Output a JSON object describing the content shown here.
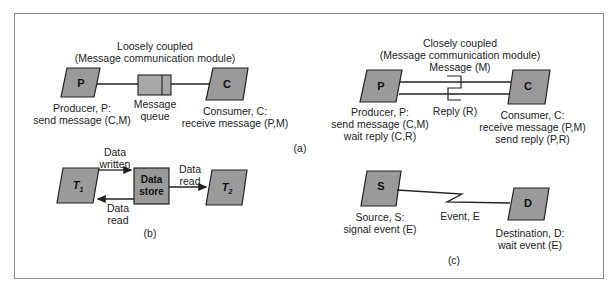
{
  "colors": {
    "node_fill": "#9a9a9a",
    "node_stroke": "#222222",
    "frame": "#8a8a8a",
    "queue_fill": "#a8a8a8"
  },
  "panel_a": {
    "label": "(a)",
    "loose": {
      "title": "Loosely coupled",
      "subtitle": "(Message communication module)",
      "producer_node": "P",
      "consumer_node": "C",
      "producer_label": [
        "Producer, P:",
        "send message (C,M)"
      ],
      "queue_label": [
        "Message",
        "queue"
      ],
      "consumer_label": [
        "Consumer, C:",
        "receive message (P,M)"
      ]
    },
    "close": {
      "title": "Closely coupled",
      "subtitle": "(Message communication module)",
      "message_label": "Message (M)",
      "reply_label": "Reply (R)",
      "producer_node": "P",
      "consumer_node": "C",
      "producer_label": [
        "Producer, P:",
        "send message (C,M)",
        "wait reply (C,R)"
      ],
      "consumer_label": [
        "Consumer, C:",
        "receive message (P,M)",
        "send reply (P,R)"
      ]
    }
  },
  "panel_b": {
    "label": "(b)",
    "t1_node": "T1",
    "t2_node": "T2",
    "store_node": [
      "Data",
      "store"
    ],
    "written_label": [
      "Data",
      "written"
    ],
    "read_back_label": [
      "Data",
      "read"
    ],
    "read_label": [
      "Data",
      "read"
    ]
  },
  "panel_c": {
    "label": "(c)",
    "source_node": "S",
    "dest_node": "D",
    "event_label": "Event, E",
    "source_label": [
      "Source, S:",
      "signal event (E)"
    ],
    "dest_label": [
      "Destination, D:",
      "wait event (E)"
    ]
  }
}
